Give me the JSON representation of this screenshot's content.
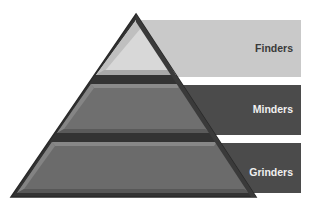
{
  "diagram": {
    "type": "pyramid",
    "tiers": [
      {
        "label": "Finders",
        "level": "top",
        "band_color": "#c9c9c9",
        "fill_color": "#d6d6d6",
        "text_color": "#3a3a3a"
      },
      {
        "label": "Minders",
        "level": "middle",
        "band_color": "#4b4b4b",
        "fill_color": "#6e6e6e",
        "text_color": "#f0f0f0"
      },
      {
        "label": "Grinders",
        "level": "bottom",
        "band_color": "#4b4b4b",
        "fill_color": "#6a6a6a",
        "text_color": "#f0f0f0"
      }
    ],
    "outline_color": "#2e2e2e",
    "divider_color": "#333333"
  }
}
